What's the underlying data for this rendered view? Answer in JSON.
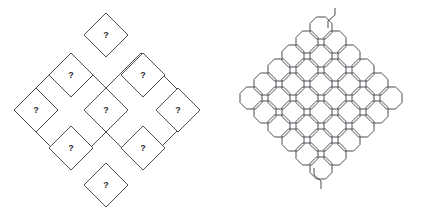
{
  "canvas": {
    "width": 428,
    "height": 218,
    "background": "#ffffff"
  },
  "style": {
    "stroke_color": "#4d4d55",
    "stroke_width": 1,
    "fill_color": "#ffffff",
    "label_color": "#2b2b31",
    "label_font_size": 9
  },
  "figures": [
    {
      "id": "left-figure",
      "name": "diamond-lattice-puzzle",
      "description": "Diamond-shaped outline containing eight small rotated squares, each marked with a question mark",
      "cell_count": 8,
      "cells": [
        {
          "id": "cell-top",
          "label": "?",
          "cx": 106,
          "cy": 35,
          "half": 22
        },
        {
          "id": "cell-upper-left",
          "label": "?",
          "cx": 71,
          "cy": 75,
          "half": 22
        },
        {
          "id": "cell-upper-right",
          "label": "?",
          "cx": 143,
          "cy": 75,
          "half": 22
        },
        {
          "id": "cell-left",
          "label": "?",
          "cx": 36,
          "cy": 110,
          "half": 22
        },
        {
          "id": "cell-center",
          "label": "?",
          "cx": 106,
          "cy": 110,
          "half": 22
        },
        {
          "id": "cell-right",
          "label": "?",
          "cx": 178,
          "cy": 110,
          "half": 22
        },
        {
          "id": "cell-lower-left",
          "label": "?",
          "cx": 71,
          "cy": 148,
          "half": 22
        },
        {
          "id": "cell-lower-right",
          "label": "?",
          "cx": 143,
          "cy": 148,
          "half": 22
        },
        {
          "id": "cell-bottom",
          "label": "?",
          "cx": 106,
          "cy": 185,
          "half": 22
        }
      ],
      "outline_path": "M 71 53 L 14 110 L 71 167 L 106 132 L 141 167 L 198 110 L 141 53 L 106 88 Z"
    },
    {
      "id": "right-figure",
      "name": "octagon-maze-pattern",
      "description": "Diamond-shaped tessellation of interlocking rounded octagon cells with open S-curve tails at the top and bottom",
      "tail_top": "open-s-curve",
      "tail_bottom": "open-s-curve",
      "octagon_radius": 11,
      "octagon_centers": [
        [
          107,
          28
        ],
        [
          93,
          42
        ],
        [
          121,
          42
        ],
        [
          79,
          56
        ],
        [
          107,
          56
        ],
        [
          135,
          56
        ],
        [
          65,
          70
        ],
        [
          93,
          70
        ],
        [
          121,
          70
        ],
        [
          149,
          70
        ],
        [
          51,
          84
        ],
        [
          79,
          84
        ],
        [
          107,
          84
        ],
        [
          135,
          84
        ],
        [
          163,
          84
        ],
        [
          37,
          98
        ],
        [
          65,
          98
        ],
        [
          93,
          98
        ],
        [
          121,
          98
        ],
        [
          149,
          98
        ],
        [
          177,
          98
        ],
        [
          51,
          112
        ],
        [
          79,
          112
        ],
        [
          107,
          112
        ],
        [
          135,
          112
        ],
        [
          163,
          112
        ],
        [
          65,
          126
        ],
        [
          93,
          126
        ],
        [
          121,
          126
        ],
        [
          149,
          126
        ],
        [
          79,
          140
        ],
        [
          107,
          140
        ],
        [
          135,
          140
        ],
        [
          93,
          154
        ],
        [
          121,
          154
        ],
        [
          107,
          168
        ]
      ]
    }
  ]
}
